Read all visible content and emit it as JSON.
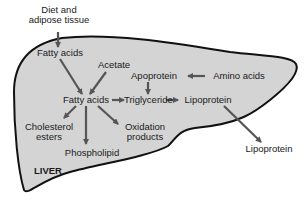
{
  "diagram": {
    "region_label": "LIVER",
    "colors": {
      "liver_fill": "#d4d4d4",
      "outline": "#111111",
      "arrow": "#555555",
      "text": "#1a1a1a",
      "background": "#ffffff"
    },
    "nodes": {
      "diet": {
        "line1": "Diet and",
        "line2": "adipose tissue"
      },
      "fatty_acids_in": "Fatty acids",
      "acetate": "Acetate",
      "fatty_acids": "Fatty acids",
      "apoprotein": "Apoprotein",
      "amino_acids": "Amino acids",
      "triglyceride": "Triglyceride",
      "lipoprotein_in": "Lipoprotein",
      "lipoprotein_out": "Lipoprotein",
      "cholesterol_esters": {
        "line1": "Cholesterol",
        "line2": "esters"
      },
      "phospholipid": "Phospholipid",
      "oxidation_products": {
        "line1": "Oxidation",
        "line2": "products"
      }
    },
    "edges": [
      {
        "from": "Diet and adipose tissue",
        "to": "Fatty acids (uptake)"
      },
      {
        "from": "Fatty acids (uptake)",
        "to": "Fatty acids"
      },
      {
        "from": "Acetate",
        "to": "Fatty acids"
      },
      {
        "from": "Fatty acids",
        "to": "Triglyceride"
      },
      {
        "from": "Amino acids",
        "to": "Apoprotein"
      },
      {
        "from": "Apoprotein",
        "to": "Triglyceride"
      },
      {
        "from": "Triglyceride",
        "to": "Lipoprotein"
      },
      {
        "from": "Lipoprotein",
        "to": "Lipoprotein (secreted)"
      },
      {
        "from": "Fatty acids",
        "to": "Cholesterol esters"
      },
      {
        "from": "Fatty acids",
        "to": "Phospholipid"
      },
      {
        "from": "Fatty acids",
        "to": "Oxidation products"
      }
    ]
  }
}
